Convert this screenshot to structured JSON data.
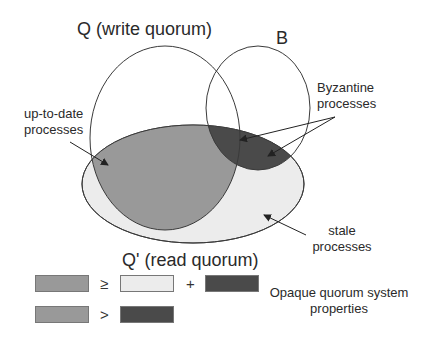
{
  "diagram": {
    "sets": {
      "Q": {
        "label": "Q (write quorum)"
      },
      "B": {
        "label": "B"
      },
      "Q_prime": {
        "label": "Q' (read quorum)"
      }
    },
    "annotations": {
      "up_to_date": {
        "line1": "up-to-date",
        "line2": "processes"
      },
      "byzantine": {
        "line1": "Byzantine",
        "line2": "processes"
      },
      "stale": {
        "line1": "stale",
        "line2": "processes"
      }
    },
    "legend": {
      "row1": {
        "op1": "≥",
        "op2": "+"
      },
      "row2": {
        "op1": ">"
      },
      "caption": {
        "line1": "Opaque quorum system",
        "line2": "properties"
      }
    },
    "colors": {
      "up_to_date_fill": "#999999",
      "stale_fill": "#ececec",
      "byzantine_fill": "#4a4a4a",
      "outline": "#3a3a3a",
      "background": "#ffffff"
    }
  }
}
